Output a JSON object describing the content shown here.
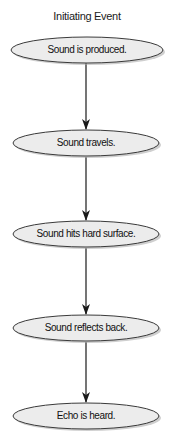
{
  "diagram": {
    "title": "Initiating Event",
    "type": "flowchart",
    "direction": "top-to-bottom",
    "colors": {
      "node_fill": "#ececec",
      "node_stroke": "#3a3a3a",
      "node_shadow": "#9a9a9a",
      "arrow": "#1a1a1a",
      "text": "#111111"
    },
    "nodes": [
      {
        "id": "n1",
        "label": "Sound is produced."
      },
      {
        "id": "n2",
        "label": "Sound travels."
      },
      {
        "id": "n3",
        "label": "Sound hits hard surface."
      },
      {
        "id": "n4",
        "label": "Sound reflects back."
      },
      {
        "id": "n5",
        "label": "Echo is heard."
      }
    ],
    "edges": [
      {
        "from": "n1",
        "to": "n2"
      },
      {
        "from": "n2",
        "to": "n3"
      },
      {
        "from": "n3",
        "to": "n4"
      },
      {
        "from": "n4",
        "to": "n5"
      }
    ]
  }
}
